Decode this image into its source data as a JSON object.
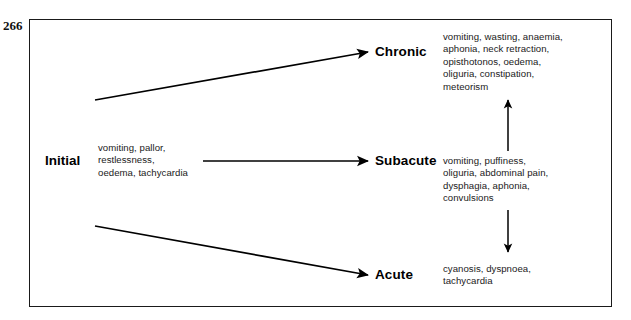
{
  "page": {
    "number": "266"
  },
  "figure": {
    "initial": {
      "label": "Initial",
      "symptoms": "vomiting, pallor,\nrestlessness,\noedema, tachycardia"
    },
    "stages": [
      {
        "id": "chronic",
        "label": "Chronic",
        "symptoms": "vomiting, wasting, anaemia,\naphonia, neck retraction,\nopisthotonos, oedema,\noliguria, constipation,\nmeteorism"
      },
      {
        "id": "subacute",
        "label": "Subacute",
        "symptoms": "vomiting, puffiness,\noliguria, abdominal pain,\ndysphagia, aphonia,\nconvulsions"
      },
      {
        "id": "acute",
        "label": "Acute",
        "symptoms": "cyanosis, dyspnoea,\ntachycardia"
      }
    ],
    "arrows": {
      "initial_to_chronic": "diagonal-up-arrow",
      "initial_to_subacute": "horizontal-arrow",
      "initial_to_acute": "diagonal-down-arrow",
      "subacute_to_chronic": "vertical-up-arrow",
      "subacute_to_acute": "vertical-down-arrow"
    },
    "colors": {
      "ink": "#000000",
      "border": "#1a1a1a",
      "background": "#ffffff"
    }
  }
}
